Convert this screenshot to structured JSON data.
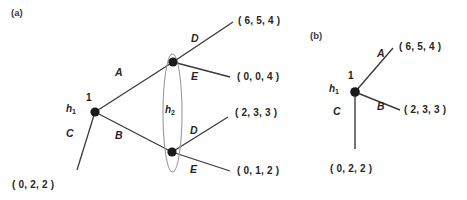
{
  "figure": {
    "width": 467,
    "height": 200,
    "background": "#ffffff",
    "line_color": "#3a3a3a",
    "node_color": "#1a1a1a",
    "infoset_color": "#8c8c8c"
  },
  "panels": [
    {
      "tag": "(a)",
      "tag_pos": {
        "x": 11,
        "y": 8
      },
      "nodes": [
        {
          "id": "root",
          "label_h": "h",
          "label_sub": "1",
          "label_player": "1",
          "x": 95,
          "y": 112,
          "r": 4.6,
          "h_pos": {
            "x": 66,
            "y": 104
          },
          "player_pos": {
            "x": 86,
            "y": 93
          }
        },
        {
          "id": "upper",
          "x": 173,
          "y": 62,
          "r": 4.6
        },
        {
          "id": "lower",
          "x": 172,
          "y": 152,
          "r": 4.6
        }
      ],
      "infoset": {
        "label": "h",
        "label_sub": "2",
        "label_pos": {
          "x": 165,
          "y": 105
        },
        "cx": 172.5,
        "cy": 113,
        "rx": 9.5,
        "ry": 59
      },
      "edges": [
        {
          "action": "A",
          "from": "root",
          "to": "upper",
          "x1": 95,
          "y1": 112,
          "x2": 173,
          "y2": 62,
          "label_pos": {
            "x": 115,
            "y": 67
          }
        },
        {
          "action": "B",
          "from": "root",
          "to": "lower",
          "x1": 95,
          "y1": 112,
          "x2": 172,
          "y2": 152,
          "label_pos": {
            "x": 115,
            "y": 130
          }
        },
        {
          "action": "C",
          "from": "root",
          "to": "terminal-c",
          "x1": 95,
          "y1": 112,
          "x2": 77,
          "y2": 170,
          "label_pos": {
            "x": 66,
            "y": 128
          }
        },
        {
          "action": "D",
          "from": "upper",
          "to": "terminal-ad",
          "x1": 173,
          "y1": 62,
          "x2": 233,
          "y2": 22,
          "label_pos": {
            "x": 191,
            "y": 33
          }
        },
        {
          "action": "E",
          "from": "upper",
          "to": "terminal-ae",
          "x1": 173,
          "y1": 62,
          "x2": 230,
          "y2": 77,
          "label_pos": {
            "x": 191,
            "y": 71
          }
        },
        {
          "action": "D",
          "from": "lower",
          "to": "terminal-bd",
          "x1": 172,
          "y1": 152,
          "x2": 228,
          "y2": 117,
          "label_pos": {
            "x": 190,
            "y": 125
          }
        },
        {
          "action": "E",
          "from": "lower",
          "to": "terminal-be",
          "x1": 172,
          "y1": 152,
          "x2": 230,
          "y2": 171,
          "label_pos": {
            "x": 190,
            "y": 164
          }
        }
      ],
      "payoffs": [
        {
          "id": "terminal-ad",
          "text": "( 6, 5, 4 )",
          "x": 238,
          "y": 16
        },
        {
          "id": "terminal-ae",
          "text": "( 0, 0, 4 )",
          "x": 237,
          "y": 72
        },
        {
          "id": "terminal-bd",
          "text": "( 2, 3, 3 )",
          "x": 235,
          "y": 108
        },
        {
          "id": "terminal-be",
          "text": "( 0, 1, 2 )",
          "x": 237,
          "y": 166
        },
        {
          "id": "terminal-c",
          "text": "( 0, 2, 2 )",
          "x": 12,
          "y": 180
        }
      ]
    },
    {
      "tag": "(b)",
      "tag_pos": {
        "x": 310,
        "y": 31
      },
      "nodes": [
        {
          "id": "root",
          "label_h": "h",
          "label_sub": "1",
          "label_player": "1",
          "x": 355,
          "y": 92,
          "r": 4.8,
          "h_pos": {
            "x": 329,
            "y": 84
          },
          "player_pos": {
            "x": 348,
            "y": 71
          }
        }
      ],
      "edges": [
        {
          "action": "A",
          "from": "root",
          "to": "terminal-a",
          "x1": 355,
          "y1": 92,
          "x2": 393,
          "y2": 48,
          "label_pos": {
            "x": 377,
            "y": 48
          }
        },
        {
          "action": "B",
          "from": "root",
          "to": "terminal-b",
          "x1": 355,
          "y1": 92,
          "x2": 400,
          "y2": 110,
          "label_pos": {
            "x": 377,
            "y": 101
          }
        },
        {
          "action": "C",
          "from": "root",
          "to": "terminal-c",
          "x1": 355,
          "y1": 92,
          "x2": 355,
          "y2": 149,
          "label_pos": {
            "x": 333,
            "y": 106
          }
        }
      ],
      "payoffs": [
        {
          "id": "terminal-a",
          "text": "( 6, 5, 4 )",
          "x": 399,
          "y": 42
        },
        {
          "id": "terminal-b",
          "text": "( 2, 3, 3 )",
          "x": 404,
          "y": 105
        },
        {
          "id": "terminal-c",
          "text": "( 0, 2, 2 )",
          "x": 330,
          "y": 164
        }
      ]
    }
  ]
}
